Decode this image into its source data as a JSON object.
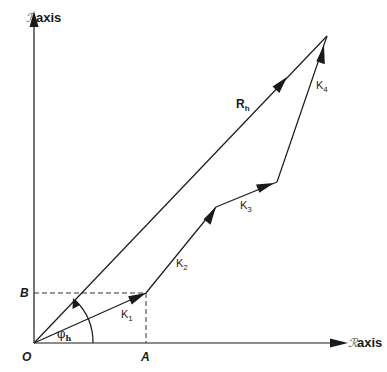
{
  "diagram": {
    "type": "vector-polygon",
    "y_axis": {
      "label": "axis",
      "script_prefix": "ℐ"
    },
    "x_axis": {
      "label": "axis",
      "script_prefix": "ℛ"
    },
    "points": {
      "origin": {
        "label": "O",
        "x": 34,
        "y": 343
      },
      "A": {
        "label": "A",
        "x": 146,
        "y": 343
      },
      "B": {
        "label": "B",
        "x": 34,
        "y": 293
      },
      "p1": {
        "x": 146,
        "y": 293
      },
      "p2": {
        "x": 216,
        "y": 207
      },
      "p3": {
        "x": 277,
        "y": 182
      },
      "p4": {
        "x": 327,
        "y": 36
      }
    },
    "vectors": [
      {
        "name": "K",
        "sub": "1"
      },
      {
        "name": "K",
        "sub": "2"
      },
      {
        "name": "K",
        "sub": "3"
      },
      {
        "name": "K",
        "sub": "4"
      }
    ],
    "resultant": {
      "name": "R",
      "sub": "h"
    },
    "angle": {
      "symbol": "φ",
      "sub": "h"
    }
  },
  "colors": {
    "ink": "#1a1a1a",
    "background": "#ffffff"
  }
}
